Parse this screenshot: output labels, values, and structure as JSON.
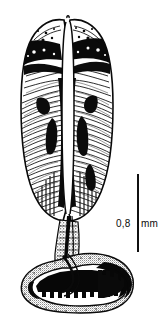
{
  "figure": {
    "caption_absent": true,
    "background_color": "#ffffff",
    "ink_color": "#000000",
    "subject_name": "bilobed-organ-with-coiled-duct",
    "width_px": 164,
    "height_px": 324
  },
  "scalebar": {
    "value": "0,8",
    "unit": "mm",
    "full_label": "0,8 mm",
    "orientation": "vertical",
    "line_color": "#101010",
    "x_px": 137,
    "top_px": 174,
    "bottom_px": 252,
    "length_px": 78
  },
  "specimen": {
    "parts": [
      {
        "id": "left-lobe",
        "label": "left lobe",
        "bbox": [
          22,
          18,
          40,
          208
        ]
      },
      {
        "id": "right-lobe",
        "label": "right lobe",
        "bbox": [
          74,
          18,
          38,
          208
        ]
      },
      {
        "id": "median-cleft",
        "label": "median cleft",
        "bbox": [
          60,
          20,
          14,
          200
        ]
      },
      {
        "id": "stalk",
        "label": "stalk",
        "bbox": [
          58,
          224,
          18,
          40
        ]
      },
      {
        "id": "coiled-duct",
        "label": "coiled duct",
        "bbox": [
          20,
          250,
          116,
          66
        ]
      }
    ]
  }
}
